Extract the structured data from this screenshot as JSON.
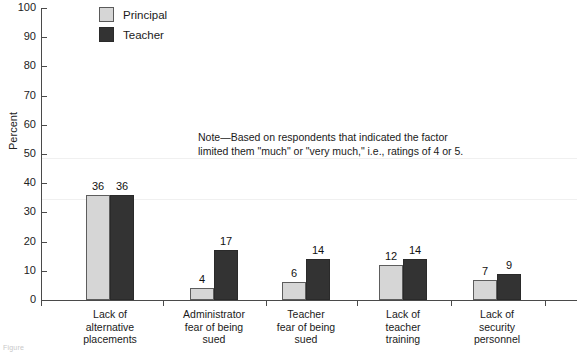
{
  "chart_data": {
    "type": "bar",
    "title": "",
    "xlabel": "",
    "ylabel": "Percent",
    "ylim": [
      0,
      100
    ],
    "yticks": [
      0,
      10,
      20,
      30,
      40,
      50,
      60,
      70,
      80,
      90,
      100
    ],
    "grid": false,
    "legend_position": "top-left",
    "categories": [
      "Lack of alternative placements",
      "Administrator fear of being sued",
      "Teacher fear of being sued",
      "Lack of teacher training",
      "Lack of security personnel"
    ],
    "category_lines": [
      [
        "Lack of",
        "alternative",
        "placements"
      ],
      [
        "Administrator",
        "fear of being",
        "sued"
      ],
      [
        "Teacher",
        "fear of being",
        "sued"
      ],
      [
        "Lack of",
        "teacher",
        "training"
      ],
      [
        "Lack of",
        "security",
        "personnel"
      ]
    ],
    "series": [
      {
        "name": "Principal",
        "color": "#d6d6d6",
        "values": [
          36,
          4,
          6,
          12,
          7
        ]
      },
      {
        "name": "Teacher",
        "color": "#333333",
        "values": [
          36,
          17,
          14,
          14,
          9
        ]
      }
    ],
    "note": {
      "line1": "Note—Based on respondents that indicated the factor",
      "line2": "limited them \"much\" or \"very much,\" i.e., ratings of 4 or 5."
    }
  },
  "figure_caption": "Figure"
}
